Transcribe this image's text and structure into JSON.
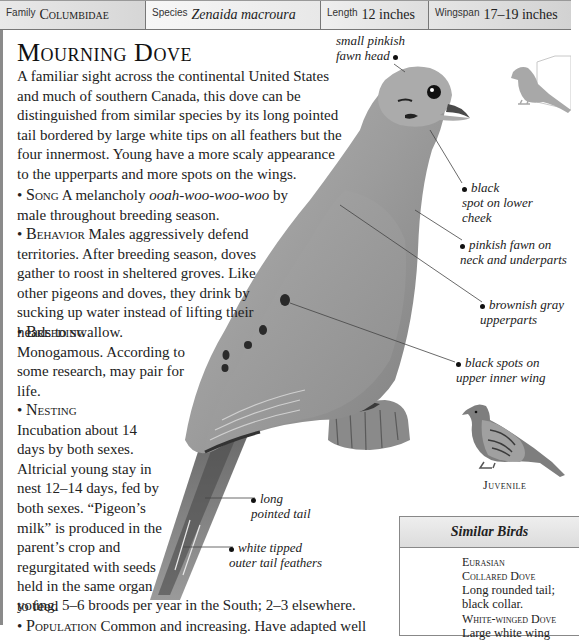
{
  "header": {
    "family": {
      "label": "Family",
      "value": "Columbidae"
    },
    "species": {
      "label": "Species",
      "value": "Zenaida macroura"
    },
    "length": {
      "label": "Length",
      "value": "12 inches"
    },
    "wingspan": {
      "label": "Wingspan",
      "value": "17–19 inches"
    }
  },
  "title": "Mourning Dove",
  "intro": "A familiar sight across the continental United States and much of southern Canada, this dove can be distinguished from similar species by its long pointed tail bordered by large white tips on all feathers but the four innermost. Young have a more scaly appearance to the upperparts and more spots on the wings.",
  "sections": {
    "song": {
      "bullet": "•",
      "head": "Song",
      "text_before": " A melancholy ",
      "call": "ooah-woo-woo-woo",
      "text_after": " by male throughout breeding season."
    },
    "behavior": {
      "bullet": "•",
      "head": "Behavior",
      "text": " Males aggressively defend territories. After breeding season, doves gather to roost in sheltered groves. Like other pigeons and doves, they drink by sucking up water instead of lifting their heads to swallow."
    },
    "breeding": {
      "bullet": "•",
      "head": "Breeding",
      "text": "Monogamous. According to some research, may pair for life."
    },
    "nesting": {
      "bullet": "•",
      "head": "Nesting",
      "text": "Incubation about 14 days by both sexes. Altricial young stay in nest 12–14 days, fed by both sexes. “Pigeon’s milk” is produced in the parent’s crop and regurgitated with seeds held in the same organ to feed",
      "text_tail": "young. 5–6 broods per year in the South; 2–3 elsewhere."
    },
    "population": {
      "bullet": "•",
      "head": "Population",
      "text": " Common and increasing. Have adapted well"
    }
  },
  "annotations": {
    "head": [
      "small pinkish",
      "fawn head"
    ],
    "cheek": [
      "black",
      "spot on lower",
      "cheek"
    ],
    "neck": [
      "pinkish fawn on",
      "neck and underparts"
    ],
    "upperparts": [
      "brownish gray",
      "upperparts"
    ],
    "wingspots": [
      "black spots on",
      "upper inner wing"
    ],
    "tail": [
      "long",
      "pointed tail"
    ],
    "tailtips": [
      "white tipped",
      "outer tail feathers"
    ]
  },
  "juvenile_label": "Juvenile",
  "similar_birds": {
    "heading": "Similar Birds",
    "items": [
      {
        "name_line1": "Eurasian",
        "name_line2": "Collared Dove",
        "description": "Long rounded tail; black collar."
      },
      {
        "name_line1": "White-winged Dove",
        "name_line2": "",
        "description": "Large white wing"
      }
    ]
  },
  "colors": {
    "bird_body": "#9a9a9a",
    "bird_dark": "#3a3a3a",
    "silhouette": "#a8a8a8",
    "header_bg": "#dedede",
    "border": "#777777"
  }
}
